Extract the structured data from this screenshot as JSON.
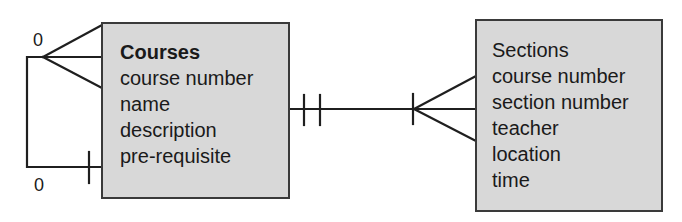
{
  "diagram": {
    "type": "entity-relationship",
    "notation": "crow's foot",
    "entities": [
      {
        "id": "courses",
        "title": "Courses",
        "title_bold": true,
        "attributes": [
          "course number",
          "name",
          "description",
          "pre-requisite"
        ]
      },
      {
        "id": "sections",
        "title": "Sections",
        "title_bold": false,
        "attributes": [
          "course number",
          "section number",
          "teacher",
          "location",
          "time"
        ]
      }
    ],
    "relationships": [
      {
        "from": "courses",
        "to": "sections",
        "from_end": "one-and-only-one",
        "to_end": "one-or-many"
      },
      {
        "from": "courses",
        "to": "courses",
        "label": "pre-requisite (recursive)",
        "top_end": "zero-or-many",
        "bottom_end": "zero-or-one"
      }
    ],
    "cardinality_labels": {
      "recursive_top": "0",
      "recursive_bottom": "0"
    }
  },
  "colors": {
    "entity_fill": "#d8d8d8",
    "line": "#1f1f1f",
    "text": "#1a1a1a",
    "background": "#ffffff"
  }
}
